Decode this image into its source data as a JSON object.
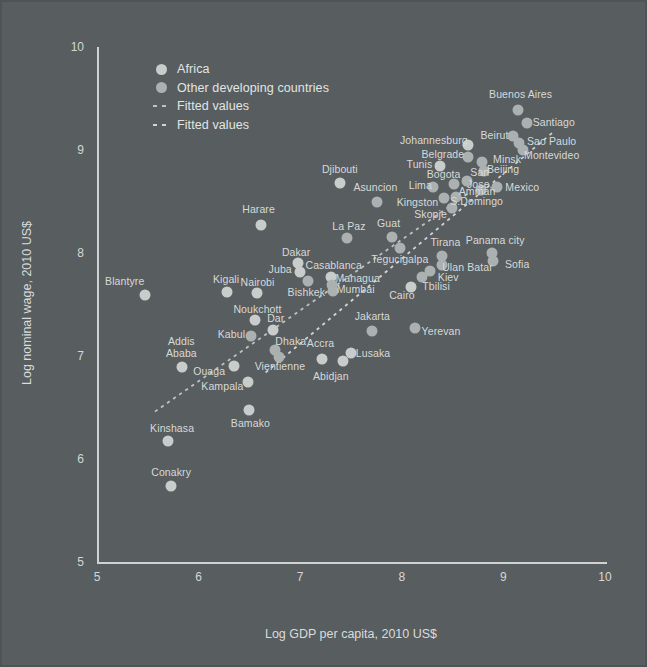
{
  "figure": {
    "background": "#585d5f",
    "legend": [
      {
        "label": "Africa",
        "marker": "circle",
        "color": "#c8cdcc"
      },
      {
        "label": "Other developing countries",
        "marker": "circle",
        "color": "#aab1b0"
      },
      {
        "label": "Fitted values",
        "marker": "dash",
        "color": "#bcc2c2"
      },
      {
        "label": "Fitted values",
        "marker": "dash",
        "color": "#d0d4d4"
      }
    ]
  },
  "chart_data": {
    "type": "scatter",
    "title": "",
    "xlabel": "Log GDP per capita, 2010 US$",
    "ylabel": "Log nominal wage, 2010 US$",
    "xlim": [
      5,
      10
    ],
    "ylim": [
      5,
      10
    ],
    "x_ticks": [
      5,
      6,
      7,
      8,
      9,
      10
    ],
    "y_ticks": [
      5,
      6,
      7,
      8,
      9,
      10
    ],
    "grid": false,
    "legend_position": "top-left-inside",
    "series": [
      {
        "name": "Africa",
        "color": "#c8cdcc",
        "points": [
          {
            "label": "Blantyre",
            "x": 5.47,
            "y": 7.59,
            "dx": -20,
            "dy": -13
          },
          {
            "label": "Kigali",
            "x": 6.28,
            "y": 7.62,
            "dx": -1,
            "dy": -12
          },
          {
            "label": "Nairobi",
            "x": 6.57,
            "y": 7.61,
            "dx": 1,
            "dy": -10
          },
          {
            "label": "Noukchott",
            "x": 6.56,
            "y": 7.35,
            "dx": 2,
            "dy": -10
          },
          {
            "label": "Dar",
            "x": 6.73,
            "y": 7.25,
            "dx": 3,
            "dy": -11
          },
          {
            "label": "Addis\nAbaba",
            "x": 5.84,
            "y": 6.89,
            "dx": -1,
            "dy": -19
          },
          {
            "label": "Ouaga",
            "x": 6.35,
            "y": 6.9,
            "dx": -25,
            "dy": 6
          },
          {
            "label": "Kampala",
            "x": 6.49,
            "y": 6.75,
            "dx": -26,
            "dy": 5
          },
          {
            "label": "Kinshasa",
            "x": 5.7,
            "y": 6.17,
            "dx": 4,
            "dy": -12
          },
          {
            "label": "Conakry",
            "x": 5.73,
            "y": 5.74,
            "dx": 0,
            "dy": -13
          },
          {
            "label": "Bamako",
            "x": 6.5,
            "y": 6.48,
            "dx": 1,
            "dy": 14
          },
          {
            "label": "Harare",
            "x": 6.61,
            "y": 8.27,
            "dx": -2,
            "dy": -15
          },
          {
            "label": "Dakar",
            "x": 6.98,
            "y": 7.9,
            "dx": -2,
            "dy": -10
          },
          {
            "label": "Juba",
            "x": 7.0,
            "y": 7.82,
            "dx": -20,
            "dy": -2
          },
          {
            "label": "Casablanca",
            "x": 7.3,
            "y": 7.77,
            "dx": 3,
            "dy": -11
          },
          {
            "label": "Cairo",
            "x": 8.09,
            "y": 7.67,
            "dx": -9,
            "dy": 9
          },
          {
            "label": "Accra",
            "x": 7.21,
            "y": 6.97,
            "dx": -1,
            "dy": -15
          },
          {
            "label": "Abidjan",
            "x": 7.42,
            "y": 6.95,
            "dx": -12,
            "dy": 16
          },
          {
            "label": "Lusaka",
            "x": 7.5,
            "y": 7.03,
            "dx": 22,
            "dy": 1
          },
          {
            "label": "Djibouti",
            "x": 7.39,
            "y": 8.68,
            "dx": 0,
            "dy": -13
          },
          {
            "label": "Tunis",
            "x": 8.38,
            "y": 8.84,
            "dx": -21,
            "dy": -1
          },
          {
            "label": "Johannesburg",
            "x": 8.65,
            "y": 9.05,
            "dx": -34,
            "dy": -4
          }
        ]
      },
      {
        "name": "Other developing countries",
        "color": "#aab1b0",
        "points": [
          {
            "label": "Kabul",
            "x": 6.52,
            "y": 7.19,
            "dx": -20,
            "dy": -1
          },
          {
            "label": "Bishkek",
            "x": 7.08,
            "y": 7.73,
            "dx": -2,
            "dy": 12
          },
          {
            "label": "Dhaka",
            "x": 6.75,
            "y": 7.06,
            "dx": 16,
            "dy": -8
          },
          {
            "label": "Vientienne",
            "x": 6.79,
            "y": 6.99,
            "dx": 1,
            "dy": 10
          },
          {
            "label": "Managua",
            "x": 7.31,
            "y": 7.69,
            "dx": 26,
            "dy": -6
          },
          {
            "label": "Mumbai",
            "x": 7.32,
            "y": 7.63,
            "dx": 23,
            "dy": -1
          },
          {
            "label": "La Paz",
            "x": 7.46,
            "y": 8.15,
            "dx": 2,
            "dy": -11
          },
          {
            "label": "Guat",
            "x": 7.9,
            "y": 8.16,
            "dx": -3,
            "dy": -13
          },
          {
            "label": "Tegucigalpa",
            "x": 7.98,
            "y": 8.05,
            "dx": 0,
            "dy": 12
          },
          {
            "label": "Jakarta",
            "x": 7.71,
            "y": 7.24,
            "dx": 0,
            "dy": -14
          },
          {
            "label": "Yerevan",
            "x": 8.13,
            "y": 7.27,
            "dx": 26,
            "dy": 4
          },
          {
            "label": "Tbilisi",
            "x": 8.2,
            "y": 7.77,
            "dx": 14,
            "dy": 10
          },
          {
            "label": "Kiev",
            "x": 8.28,
            "y": 7.83,
            "dx": 18,
            "dy": 7
          },
          {
            "label": "Ulan Batar",
            "x": 8.4,
            "y": 7.88,
            "dx": 25,
            "dy": 3
          },
          {
            "label": "Tirana",
            "x": 8.4,
            "y": 7.97,
            "dx": 3,
            "dy": -13
          },
          {
            "label": "Asuncion",
            "x": 7.76,
            "y": 8.5,
            "dx": -2,
            "dy": -14
          },
          {
            "label": "Kingston",
            "x": 8.42,
            "y": 8.53,
            "dx": -27,
            "dy": 5
          },
          {
            "label": "S.Domingo",
            "x": 8.53,
            "y": 8.54,
            "dx": 21,
            "dy": 5
          },
          {
            "label": "Skopje",
            "x": 8.49,
            "y": 8.44,
            "dx": -21,
            "dy": 7
          },
          {
            "label": "Lima",
            "x": 8.31,
            "y": 8.64,
            "dx": -13,
            "dy": -1
          },
          {
            "label": "Bogota",
            "x": 8.51,
            "y": 8.67,
            "dx": -10,
            "dy": -9
          },
          {
            "label": "San\nJose,",
            "x": 8.64,
            "y": 8.7,
            "dx": 13,
            "dy": -2
          },
          {
            "label": "Amman",
            "x": 8.78,
            "y": 8.61,
            "dx": -4,
            "dy": 2
          },
          {
            "label": "Mexico",
            "x": 8.94,
            "y": 8.64,
            "dx": 25,
            "dy": 1
          },
          {
            "label": "Belgrade",
            "x": 8.65,
            "y": 8.93,
            "dx": -25,
            "dy": -2
          },
          {
            "label": "Minsk",
            "x": 8.79,
            "y": 8.88,
            "dx": 25,
            "dy": -2
          },
          {
            "label": "Beijing",
            "x": 8.81,
            "y": 8.8,
            "dx": 19,
            "dy": -1
          },
          {
            "label": "Panama city",
            "x": 8.89,
            "y": 8.0,
            "dx": 3,
            "dy": -12
          },
          {
            "label": "Sofia",
            "x": 8.9,
            "y": 7.92,
            "dx": 24,
            "dy": 4
          },
          {
            "label": "Beirut",
            "x": 9.09,
            "y": 9.14,
            "dx": -18,
            "dy": 0
          },
          {
            "label": "Sao Paulo",
            "x": 9.15,
            "y": 9.07,
            "dx": 33,
            "dy": -1
          },
          {
            "label": "Montevideo",
            "x": 9.19,
            "y": 9.0,
            "dx": 29,
            "dy": 6
          },
          {
            "label": "Buenos Aires",
            "x": 9.14,
            "y": 9.39,
            "dx": 3,
            "dy": -15
          },
          {
            "label": "Santiago",
            "x": 9.23,
            "y": 9.26,
            "dx": 27,
            "dy": 0
          }
        ]
      }
    ],
    "fitted_lines": [
      {
        "name": "Fitted values",
        "series": "Africa",
        "x1": 5.57,
        "y1": 6.46,
        "x2": 8.67,
        "y2": 8.59,
        "color": "#bcc2c2"
      },
      {
        "name": "Fitted values",
        "series": "Other developing countries",
        "x1": 6.66,
        "y1": 6.84,
        "x2": 9.51,
        "y2": 9.19,
        "color": "#d0d4d4"
      }
    ]
  }
}
